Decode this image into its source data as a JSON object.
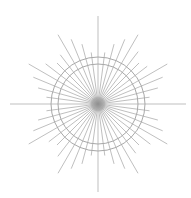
{
  "diagram": {
    "type": "radial-burst",
    "center": {
      "x": 98,
      "y": 104
    },
    "ray_count": 48,
    "ray_angle_step_deg": 7.5,
    "ray_lengths_cycle": [
      88,
      52,
      62,
      70,
      80,
      62,
      58,
      66,
      80,
      70,
      62,
      52
    ],
    "circles": [
      {
        "r": 40
      },
      {
        "r": 47
      }
    ],
    "colors": {
      "background": "#ffffff",
      "ray": "#b8b8b8",
      "circle": "#a8a8a8",
      "center_glow": "#8c8c8c"
    }
  }
}
